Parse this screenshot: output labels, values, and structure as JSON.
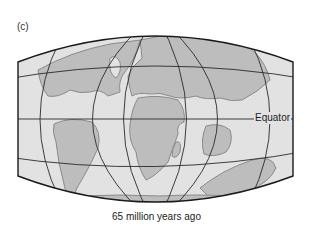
{
  "figure": {
    "panel_label": "(c)",
    "caption": "65 million years ago",
    "equator_label": "Equator",
    "colors": {
      "ocean": "#e2e2e2",
      "land": "#bdbdbd",
      "coast": "#8a8a8a",
      "grid": "#2a2a2a",
      "border": "#1a1a1a"
    },
    "projection": "oval world map with graticule lines",
    "continents": [
      "North America",
      "South America",
      "Europe",
      "Africa",
      "India",
      "Antarctica",
      "Australia"
    ]
  }
}
